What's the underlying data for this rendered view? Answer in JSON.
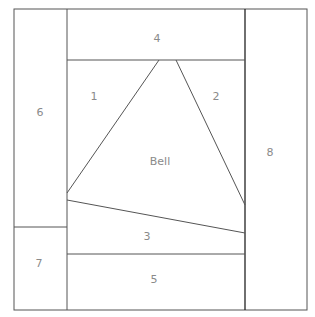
{
  "diagram": {
    "type": "foundation-paper-piecing-pattern",
    "pieces": [
      {
        "id": "piece-1",
        "label": "1"
      },
      {
        "id": "piece-2",
        "label": "2"
      },
      {
        "id": "piece-3",
        "label": "3"
      },
      {
        "id": "piece-4",
        "label": "4"
      },
      {
        "id": "piece-5",
        "label": "5"
      },
      {
        "id": "piece-6",
        "label": "6"
      },
      {
        "id": "piece-7",
        "label": "7"
      },
      {
        "id": "piece-8",
        "label": "8"
      },
      {
        "id": "piece-bell",
        "label": "Bell"
      }
    ],
    "colors": {
      "line": "#555555",
      "label": "#8a8a8a",
      "background": "#ffffff"
    }
  }
}
